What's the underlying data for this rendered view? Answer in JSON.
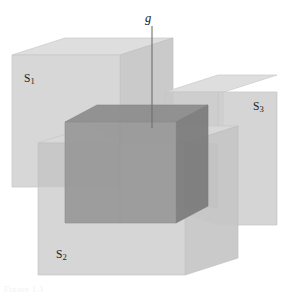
{
  "figure": {
    "background_color": "#ffffff",
    "caption_fragment": "Figure 1.1",
    "labels": {
      "s1": {
        "base": "S",
        "sub": "1"
      },
      "s2": {
        "base": "S",
        "sub": "2"
      },
      "s3": {
        "base": "S",
        "sub": "3"
      },
      "g": "g"
    },
    "colors": {
      "cube_fill_light": "#cfcfcf",
      "cube_top_light": "#dcdcdc",
      "cube_side_light": "#c4c4c4",
      "overlap_mid": "#b4b4b4",
      "intersection_top": "#8e8e8e",
      "intersection_front": "#9a9a9a",
      "intersection_side": "#7d7d7d",
      "outline": "#b9b9b9",
      "leader_line": "#6e6e6e",
      "label_text": "#1d1d1d"
    },
    "geometry": {
      "cube_s1": {
        "name": "S1",
        "position": "upper-left",
        "front_x": 12,
        "front_y": 55,
        "front_w": 108,
        "front_h": 132,
        "depth_x": 53,
        "depth_y": -17
      },
      "cube_s3": {
        "name": "S3",
        "position": "right",
        "front_x": 218,
        "front_y": 92,
        "front_w": 59,
        "front_h": 133,
        "depth_x": 53,
        "depth_y": -17
      },
      "cube_s2": {
        "name": "S2",
        "position": "lower-center",
        "front_x": 38,
        "front_y": 143,
        "front_w": 147,
        "front_h": 132,
        "depth_x": 53,
        "depth_y": -17
      },
      "intersection_g": {
        "name": "g",
        "front_x": 65,
        "front_y": 122,
        "front_w": 111,
        "front_h": 101,
        "depth_x": 32,
        "depth_y": -17
      },
      "leader": {
        "x": 152,
        "y_top": 26,
        "y_bottom": 128
      }
    }
  }
}
